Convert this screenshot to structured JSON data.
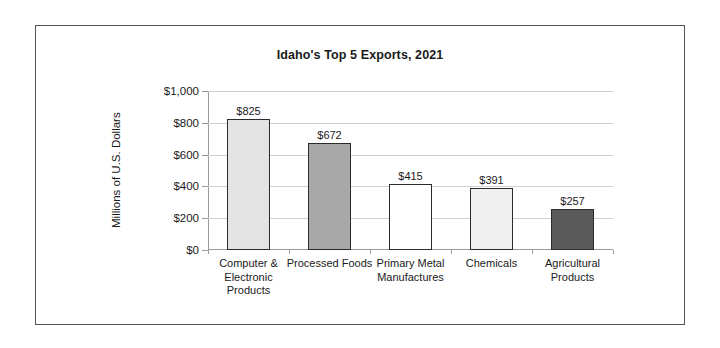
{
  "figure": {
    "border_color": "#555555",
    "background": "#ffffff"
  },
  "chart_data": {
    "type": "bar",
    "title": "Idaho's Top 5 Exports, 2021",
    "xlabel": "",
    "ylabel": "Millions of U.S. Dollars",
    "categories": [
      "Computer & Electronic Products",
      "Processed Foods",
      "Primary Metal Manufactures",
      "Chemicals",
      "Agricultural Products"
    ],
    "values": [
      825,
      672,
      415,
      391,
      257
    ],
    "value_labels": [
      "$825",
      "$672",
      "$415",
      "$391",
      "$257"
    ],
    "bar_colors": [
      "#e3e3e3",
      "#a8a8a8",
      "#ffffff",
      "#f0f0f0",
      "#5a5a5a"
    ],
    "bar_edge_color": "#2b2b2b",
    "ylim": [
      0,
      1000
    ],
    "yticks": [
      0,
      200,
      400,
      600,
      800,
      1000
    ],
    "ytick_labels": [
      "$0",
      "$200",
      "$400",
      "$600",
      "$800",
      "$1,000"
    ],
    "grid": "horizontal",
    "gridline_color": "#d0d0d0",
    "axis_color": "#9a9a9a",
    "legend": "none"
  }
}
